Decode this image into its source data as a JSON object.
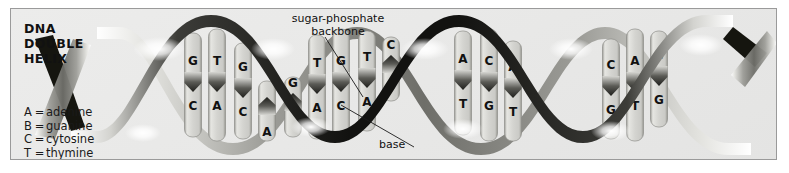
{
  "figure": {
    "title_lines": [
      "DNA",
      "DOUBLE",
      "HELIX"
    ],
    "background_color": "#e9e9e8",
    "border_color": "#9a9a9a",
    "paper_color": "#ffffff"
  },
  "legend": {
    "rows": [
      {
        "key": "A",
        "eq": "=",
        "name": "adenine"
      },
      {
        "key": "B",
        "eq": "=",
        "name": "guanine"
      },
      {
        "key": "C",
        "eq": "=",
        "name": "cytosine"
      },
      {
        "key": "T",
        "eq": "=",
        "name": "thymine"
      }
    ]
  },
  "callouts": {
    "backbone": "sugar-phosphate\nbackbone",
    "base": "base"
  },
  "colors": {
    "strand_dark": "#14140f",
    "strand_mid": "#6f6f6a",
    "strand_light": "#d8d8d4",
    "highlight": "#ffffff",
    "rung_face": "#d5d5d2",
    "rung_edge": "#8e8e8a",
    "rung_notch": "#3a3a36",
    "letter": "#111111"
  },
  "helix": {
    "turns": 4,
    "amplitude_px": 62,
    "period_px": 152,
    "center_y": 76,
    "base_pairs": [
      {
        "top": "G",
        "bottom": "C"
      },
      {
        "top": "T",
        "bottom": "A"
      },
      {
        "top": "G",
        "bottom": "C"
      },
      {
        "top": "",
        "bottom": "A"
      },
      {
        "top": "G",
        "bottom": ""
      },
      {
        "top": "T",
        "bottom": "A"
      },
      {
        "top": "G",
        "bottom": "C"
      },
      {
        "top": "T",
        "bottom": "A"
      },
      {
        "top": "C",
        "bottom": ""
      },
      {
        "top": "A",
        "bottom": "T"
      },
      {
        "top": "C",
        "bottom": "G"
      },
      {
        "top": "A",
        "bottom": "T"
      },
      {
        "top": "C",
        "bottom": "G"
      },
      {
        "top": "A",
        "bottom": "T"
      },
      {
        "top": "C",
        "bottom": "G"
      }
    ]
  }
}
